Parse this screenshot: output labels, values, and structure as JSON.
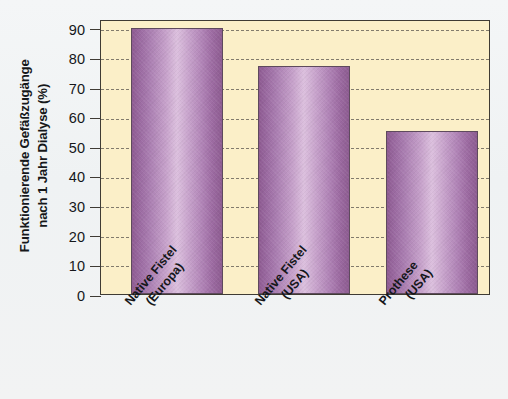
{
  "chart_data": {
    "type": "bar",
    "title": "",
    "xlabel": "",
    "ylabel": "Funktionierende Gefäßzugänge nach 1 Jahr Dialyse (%)",
    "ylabel_line1": "Funktionierende Gefäßzugänge",
    "ylabel_line2": "nach 1 Jahr Dialyse (%)",
    "categories": [
      "Native Fistel (Europa)",
      "Native Fistel (USA)",
      "Prothese (USA)"
    ],
    "category_lines": [
      [
        "Native Fistel",
        "(Europa)"
      ],
      [
        "Native Fistel",
        "(USA)"
      ],
      [
        "Prothese",
        "(USA)"
      ]
    ],
    "values": [
      90,
      77,
      55
    ],
    "ylim": [
      0,
      93
    ],
    "yticks": [
      0,
      10,
      20,
      30,
      40,
      50,
      60,
      70,
      80,
      90
    ],
    "ytick_labels": [
      "0",
      "10",
      "20",
      "30",
      "40",
      "50",
      "60",
      "70",
      "80",
      "90"
    ],
    "grid": true,
    "grid_style": "dashed",
    "legend": null,
    "legend_position": "none",
    "colors": {
      "bar_edge_dark": "#8e5b92",
      "bar_center_light": "#dcc0de",
      "bar_outline": "#5e4a5d",
      "plot_background": "#fbefc8",
      "figure_background": "#f2f4f5",
      "axis_line": "#3f3b34",
      "grid_line": "#6d675c",
      "text": "#15171a"
    }
  }
}
